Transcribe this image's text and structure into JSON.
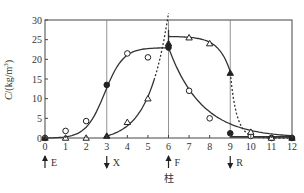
{
  "chart_data": {
    "type": "line",
    "title": "",
    "xlabel": "",
    "ylabel": "C/(kg/m³)",
    "ylabel_main": "C",
    "ylabel_unit": "/(kg/m",
    "ylabel_sup": "3",
    "ylabel_close": ")",
    "xlim": [
      0,
      12
    ],
    "ylim": [
      0,
      30
    ],
    "xticks": [
      0,
      1,
      2,
      3,
      4,
      5,
      6,
      7,
      8,
      9,
      10,
      11,
      12
    ],
    "yticks": [
      0,
      5,
      10,
      15,
      20,
      25,
      30
    ],
    "vertical_lines": [
      3,
      6,
      9
    ],
    "annotations": [
      {
        "x": 0,
        "direction": "up",
        "label": "E"
      },
      {
        "x": 3,
        "direction": "down",
        "label": "X"
      },
      {
        "x": 6,
        "direction": "up",
        "label": "F",
        "sublabel": "柱"
      },
      {
        "x": 9,
        "direction": "down",
        "label": "R"
      }
    ],
    "series": [
      {
        "name": "circles",
        "marker": "circle",
        "x": [
          0,
          1,
          2,
          3,
          4,
          5,
          6,
          7,
          8,
          9,
          10,
          11,
          12
        ],
        "values": [
          0,
          1.8,
          4.3,
          13.5,
          21.5,
          20.5,
          23,
          12,
          5,
          1.2,
          0.5,
          0,
          0
        ],
        "filled_at": [
          3,
          6,
          9,
          11,
          12
        ]
      },
      {
        "name": "triangles",
        "marker": "triangle",
        "x": [
          0,
          1,
          2,
          3,
          4,
          5,
          6,
          7,
          8,
          9,
          10,
          11,
          12
        ],
        "values": [
          0,
          0,
          0,
          0.5,
          4,
          10,
          24,
          25.5,
          24,
          16.5,
          1.5,
          0,
          0
        ],
        "filled_at": [
          0,
          3,
          6,
          9,
          12
        ]
      }
    ],
    "grid": false,
    "legend": "none"
  }
}
